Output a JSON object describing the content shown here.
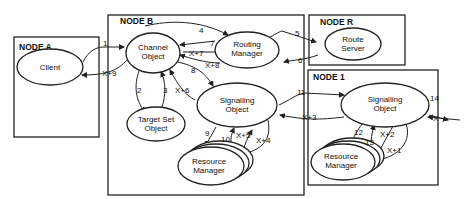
{
  "nodes": {
    "a": {
      "label": "NODE A"
    },
    "b": {
      "label": "NODE B"
    },
    "r": {
      "label": "NODE R"
    },
    "one": {
      "label": "NODE 1"
    }
  },
  "objects": {
    "client": {
      "line1": "Client"
    },
    "channel": {
      "line1": "Channel",
      "line2": "Object"
    },
    "routing": {
      "line1": "Routing",
      "line2": "Manager"
    },
    "route_server": {
      "line1": "Route",
      "line2": "Server"
    },
    "target_set": {
      "line1": "Target Set",
      "line2": "Object"
    },
    "signalling_b": {
      "line1": "Signalling",
      "line2": "Object"
    },
    "resource_b": {
      "line1": "Resource",
      "line2": "Manager"
    },
    "signalling_1": {
      "line1": "Signalling",
      "line2": "Object"
    },
    "resource_1": {
      "line1": "Resource",
      "line2": "Manager"
    }
  },
  "edges": {
    "e1": "1",
    "e2": "2",
    "e3": "3",
    "e4": "4",
    "e5": "5",
    "e6": "6",
    "e7": "7",
    "e8": "8",
    "e9": "9",
    "e10": "10",
    "e11": "11",
    "e12": "12",
    "e13": "13",
    "e14": "14",
    "ex": "X",
    "ex1": "X+1",
    "ex2": "X+2",
    "ex3": "X+3",
    "ex4": "X+4",
    "ex5": "X+5",
    "ex6": "X+6",
    "ex7": "X+7",
    "ex8": "X+8",
    "ex9": "X+9"
  }
}
